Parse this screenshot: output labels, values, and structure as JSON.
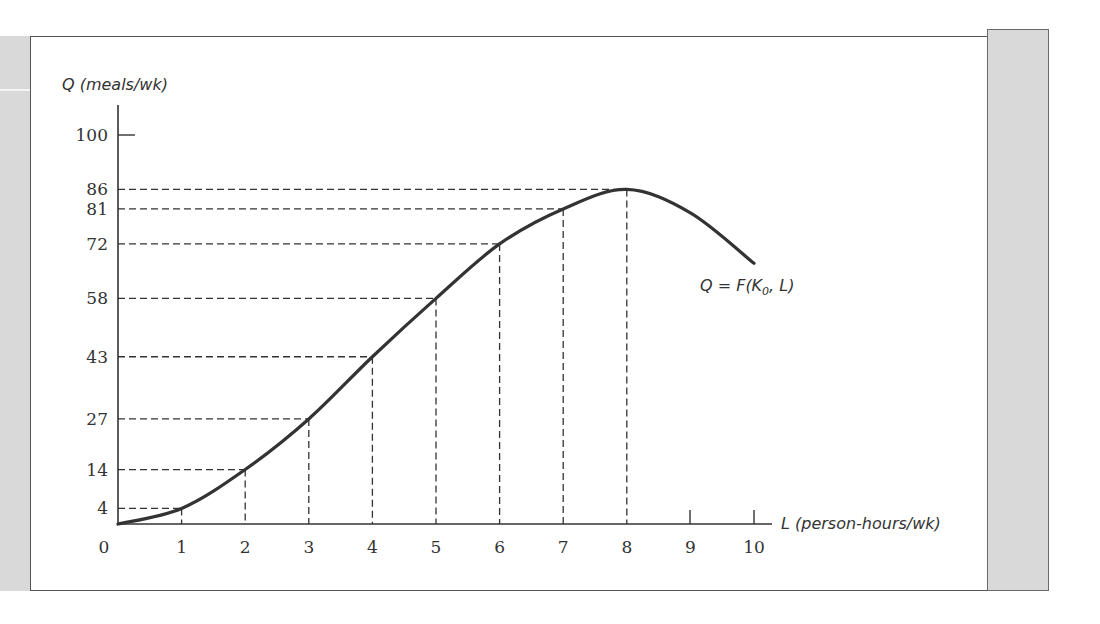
{
  "chart_data": {
    "type": "line",
    "title": "",
    "xlabel": "L (person-hours/wk)",
    "ylabel": "Q (meals/wk)",
    "curve_label": "Q = F(K",
    "curve_label_sub": "0",
    "curve_label_tail": ", L)",
    "x_ticks": [
      "0",
      "1",
      "2",
      "3",
      "4",
      "5",
      "6",
      "7",
      "8",
      "9",
      "10"
    ],
    "y_ticks": [
      "4",
      "14",
      "27",
      "43",
      "58",
      "72",
      "81",
      "86",
      "100"
    ],
    "xlim": [
      0,
      10
    ],
    "ylim": [
      0,
      100
    ],
    "grid": false,
    "legend": "none",
    "series": [
      {
        "name": "Q = F(K0, L)",
        "x": [
          0,
          1,
          2,
          3,
          4,
          5,
          6,
          7,
          8,
          9,
          10
        ],
        "values": [
          0,
          4,
          14,
          27,
          43,
          58,
          72,
          81,
          86,
          80,
          67
        ]
      }
    ],
    "reference_lines": [
      {
        "L": 1,
        "Q": 4
      },
      {
        "L": 2,
        "Q": 14
      },
      {
        "L": 3,
        "Q": 27
      },
      {
        "L": 4,
        "Q": 43
      },
      {
        "L": 5,
        "Q": 58
      },
      {
        "L": 6,
        "Q": 72
      },
      {
        "L": 7,
        "Q": 81
      },
      {
        "L": 8,
        "Q": 86
      }
    ]
  },
  "colors": {
    "axis": "#333333",
    "curve": "#333333",
    "panel": "#d9d9d9"
  }
}
